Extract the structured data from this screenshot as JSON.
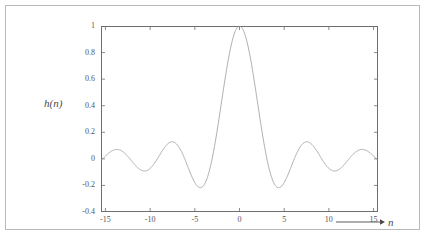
{
  "figure": {
    "background_color": "#ffffff",
    "frame_color": "#b9b9b9",
    "curve_color": "#9a9a9a",
    "axis_color": "#6e6e6e",
    "text_color": "#555555"
  },
  "axis_titles": {
    "y": "h(n)",
    "x": "n",
    "x_arrow_icon": "right-arrow-icon"
  },
  "chart_data": {
    "type": "line",
    "title": "",
    "subtitle": "",
    "xlabel": "n",
    "ylabel": "h(n)",
    "xlim": [
      -15.5,
      15.5
    ],
    "ylim": [
      -0.4,
      1.0
    ],
    "xticks": [
      -15,
      -10,
      -5,
      0,
      5,
      10,
      15
    ],
    "xticklabels": [
      "-15",
      "-10",
      "-5",
      "0",
      "5",
      "10",
      "15"
    ],
    "yticks": [
      -0.4,
      -0.2,
      0,
      0.2,
      0.4,
      0.6,
      0.8,
      1
    ],
    "yticklabels": [
      "-0.4",
      "-0.2",
      "0",
      "0.2",
      "0.4",
      "0.6",
      "0.8",
      "1"
    ],
    "grid": false,
    "legend": null,
    "legend_position": "none",
    "tick_direction": "in",
    "series": [
      {
        "name": "h(n)",
        "description": "sinc-like impulse response, sin(pi*n/3.6)/(pi*n/3.6) style main lobe peaking at 1 at n=0",
        "formula": "sinc(n/2.6) with mild decay",
        "color": "#9a9a9a",
        "linewidth": 0.7,
        "x": [
          -15.5,
          -15,
          -14.5,
          -14,
          -13.5,
          -13,
          -12.5,
          -12,
          -11.5,
          -11,
          -10.5,
          -10,
          -9.5,
          -9,
          -8.5,
          -8,
          -7.5,
          -7,
          -6.5,
          -6,
          -5.5,
          -5,
          -4.5,
          -4,
          -3.5,
          -3,
          -2.5,
          -2,
          -1.5,
          -1,
          -0.5,
          0,
          0.5,
          1,
          1.5,
          2,
          2.5,
          3,
          3.5,
          4,
          4.5,
          5,
          5.5,
          6,
          6.5,
          7,
          7.5,
          8,
          8.5,
          9,
          9.5,
          10,
          10.5,
          11,
          11.5,
          12,
          12.5,
          13,
          13.5,
          14,
          14.5,
          15,
          15.5
        ],
        "y": [
          0.0,
          0.02,
          0.05,
          0.07,
          0.07,
          0.05,
          0.02,
          -0.02,
          -0.06,
          -0.09,
          -0.09,
          -0.07,
          -0.02,
          0.04,
          0.1,
          0.13,
          0.13,
          0.1,
          0.04,
          -0.04,
          -0.13,
          -0.19,
          -0.21,
          -0.2,
          -0.13,
          -0.02,
          0.15,
          0.35,
          0.57,
          0.77,
          0.93,
          1.0,
          0.93,
          0.77,
          0.57,
          0.35,
          0.15,
          -0.02,
          -0.13,
          -0.2,
          -0.21,
          -0.19,
          -0.13,
          -0.04,
          0.04,
          0.1,
          0.13,
          0.13,
          0.1,
          0.04,
          -0.02,
          -0.07,
          -0.09,
          -0.09,
          -0.06,
          -0.02,
          0.02,
          0.05,
          0.07,
          0.07,
          0.05,
          0.02,
          0.0
        ]
      }
    ],
    "key_points": {
      "main_peak": {
        "x": 0,
        "y": 1.0
      },
      "first_zero_crossings": [
        -3.05,
        3.05
      ],
      "first_minima": [
        {
          "x": -4.4,
          "y": -0.21
        },
        {
          "x": 4.4,
          "y": -0.21
        }
      ],
      "second_maxima": [
        {
          "x": -7.7,
          "y": 0.133
        },
        {
          "x": 7.7,
          "y": 0.133
        }
      ],
      "second_minima": [
        {
          "x": -10.8,
          "y": -0.09
        },
        {
          "x": 10.8,
          "y": -0.09
        }
      ],
      "third_maxima": [
        {
          "x": -14.0,
          "y": 0.072
        },
        {
          "x": 14.0,
          "y": 0.072
        }
      ]
    }
  }
}
